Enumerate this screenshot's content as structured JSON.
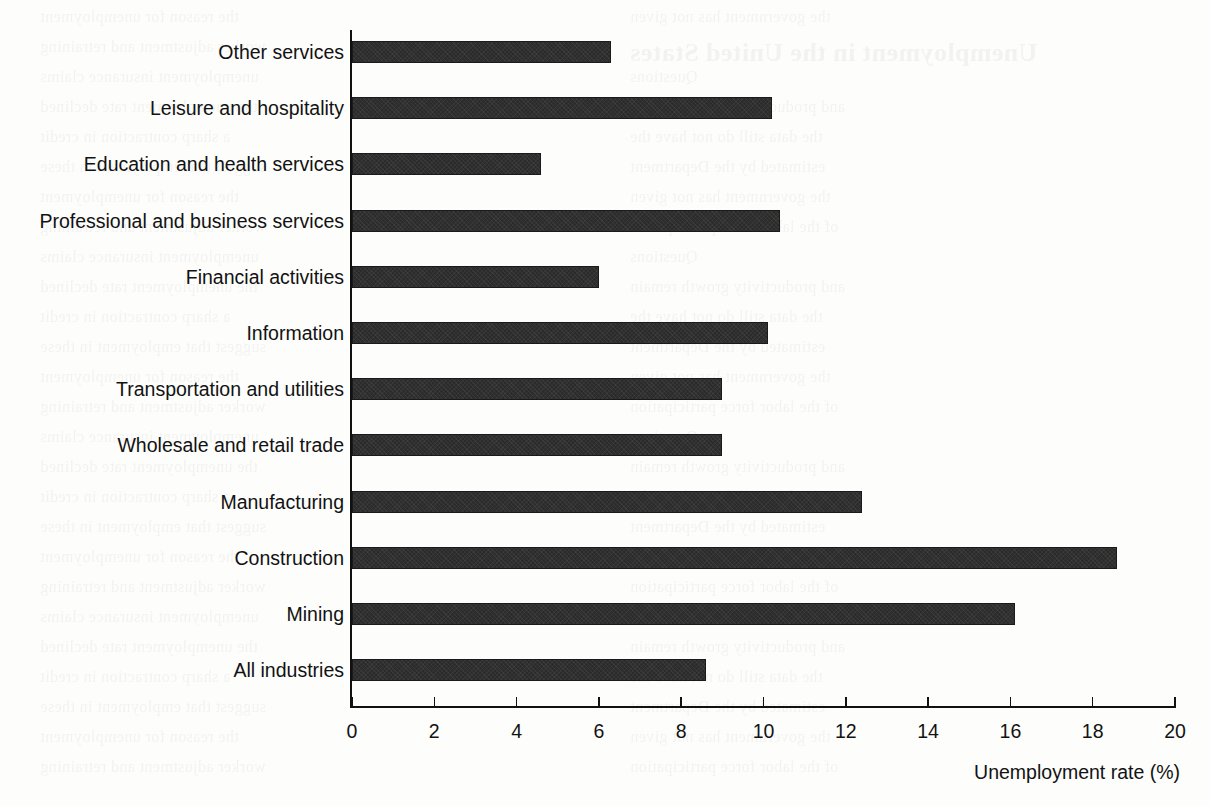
{
  "chart_data": {
    "type": "bar",
    "orientation": "horizontal",
    "title": "",
    "subtitle": "",
    "xlabel": "Unemployment rate (%)",
    "ylabel": "",
    "xlim": [
      0,
      20
    ],
    "xticks": [
      0,
      2,
      4,
      6,
      8,
      10,
      12,
      14,
      16,
      18,
      20
    ],
    "xtick_labels": [
      "0",
      "2",
      "4",
      "6",
      "8",
      "10",
      "12",
      "14",
      "16",
      "18",
      "20"
    ],
    "grid": false,
    "legend": null,
    "bar_color": "#2b2b2b",
    "categories": [
      "Other services",
      "Leisure and hospitality",
      "Education and health services",
      "Professional and business services",
      "Financial activities",
      "Information",
      "Transportation and utilities",
      "Wholesale and retail trade",
      "Manufacturing",
      "Construction",
      "Mining",
      "All industries"
    ],
    "values": [
      6.3,
      10.2,
      4.6,
      10.4,
      6.0,
      10.1,
      9.0,
      9.0,
      12.4,
      18.6,
      16.1,
      8.6
    ],
    "series": [
      {
        "name": "Unemployment rate (%)",
        "values": [
          6.3,
          10.2,
          4.6,
          10.4,
          6.0,
          10.1,
          9.0,
          9.0,
          12.4,
          18.6,
          16.1,
          8.6
        ]
      }
    ]
  },
  "ghost_text": [
    "the reason for unemployment",
    "the government has not given",
    "worker adjustment and retraining",
    "of the labor force participation",
    "unemployment insurance claims",
    "Questions",
    "the unemployment rate declined",
    "and productivity growth remain",
    "a sharp contraction in credit",
    "the data still do not have the",
    "suggest that employment in these",
    "estimated by the Department"
  ],
  "ghost_heading": "Unemployment in the United States"
}
